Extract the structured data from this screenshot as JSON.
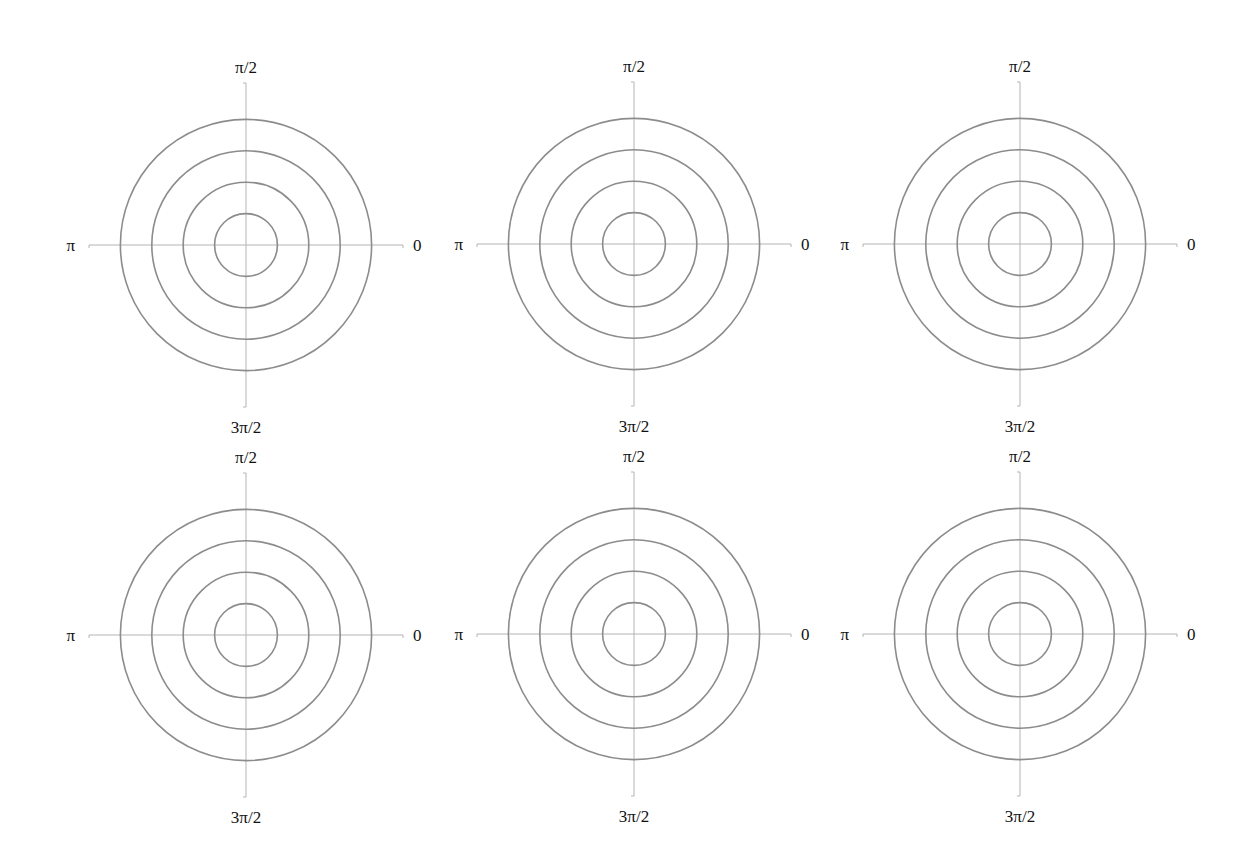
{
  "chart_data": {
    "type": "polar-grid",
    "title": "",
    "layout": {
      "rows": 2,
      "cols": 3
    },
    "panels": [
      {
        "row": 0,
        "col": 0,
        "center": [
          246,
          245
        ],
        "ring_radii": [
          1,
          2,
          3,
          4
        ],
        "angle_labels": {
          "0": "0",
          "90": "π/2",
          "180": "π",
          "270": "3π/2"
        },
        "data": []
      },
      {
        "row": 0,
        "col": 1,
        "center": [
          634,
          244
        ],
        "ring_radii": [
          1,
          2,
          3,
          4
        ],
        "angle_labels": {
          "0": "0",
          "90": "π/2",
          "180": "π",
          "270": "3π/2"
        },
        "data": []
      },
      {
        "row": 0,
        "col": 2,
        "center": [
          1020,
          244
        ],
        "ring_radii": [
          1,
          2,
          3,
          4
        ],
        "angle_labels": {
          "0": "0",
          "90": "π/2",
          "180": "π",
          "270": "3π/2"
        },
        "data": []
      },
      {
        "row": 1,
        "col": 0,
        "center": [
          246,
          635
        ],
        "ring_radii": [
          1,
          2,
          3,
          4
        ],
        "angle_labels": {
          "0": "0",
          "90": "π/2",
          "180": "π",
          "270": "3π/2"
        },
        "data": []
      },
      {
        "row": 1,
        "col": 1,
        "center": [
          634,
          634
        ],
        "ring_radii": [
          1,
          2,
          3,
          4
        ],
        "angle_labels": {
          "0": "0",
          "90": "π/2",
          "180": "π",
          "270": "3π/2"
        },
        "data": []
      },
      {
        "row": 1,
        "col": 2,
        "center": [
          1020,
          634
        ],
        "ring_radii": [
          1,
          2,
          3,
          4
        ],
        "angle_labels": {
          "0": "0",
          "90": "π/2",
          "180": "π",
          "270": "3π/2"
        },
        "data": []
      }
    ],
    "grid": true,
    "legend": null
  },
  "style": {
    "ring_color": "#8c8c8c",
    "axis_color": "#b4b4b4",
    "label_color": "#111111",
    "ring_unit_px": 31.4,
    "axis_half_length_x": 157,
    "axis_half_length_y": 162
  },
  "labels": {
    "right": "0",
    "top": "π/2",
    "left": "π",
    "bottom": "3π/2"
  }
}
